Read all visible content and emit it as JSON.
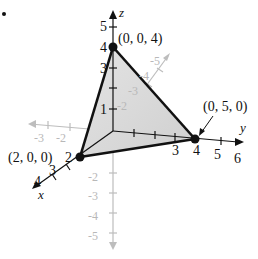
{
  "figure": {
    "bullet": "•",
    "axis_labels": {
      "x": "x",
      "y": "y",
      "z": "z"
    },
    "points": [
      {
        "label": "(0, 0, 4)",
        "coords": [
          0,
          0,
          4
        ]
      },
      {
        "label": "(0, 5, 0)",
        "coords": [
          0,
          5,
          0
        ]
      },
      {
        "label": "(2, 0, 0)",
        "coords": [
          2,
          0,
          0
        ]
      }
    ],
    "z_ticks": [
      "1",
      "3",
      "4",
      "5"
    ],
    "neg_z_ticks": [
      "-2",
      "-3",
      "-4",
      "-5"
    ],
    "y_ticks": [
      "3",
      "4",
      "5",
      "6"
    ],
    "neg_y_ticks": [
      "-2",
      "-3",
      "-4",
      "-5"
    ],
    "x_ticks": [
      "2",
      "3",
      "4"
    ],
    "neg_x_ticks": [
      "-3",
      "-2"
    ],
    "colors": {
      "triangle_fill": "#d9d9d9",
      "edges": "#111111",
      "hidden_axes": "#bdbdbd"
    }
  }
}
